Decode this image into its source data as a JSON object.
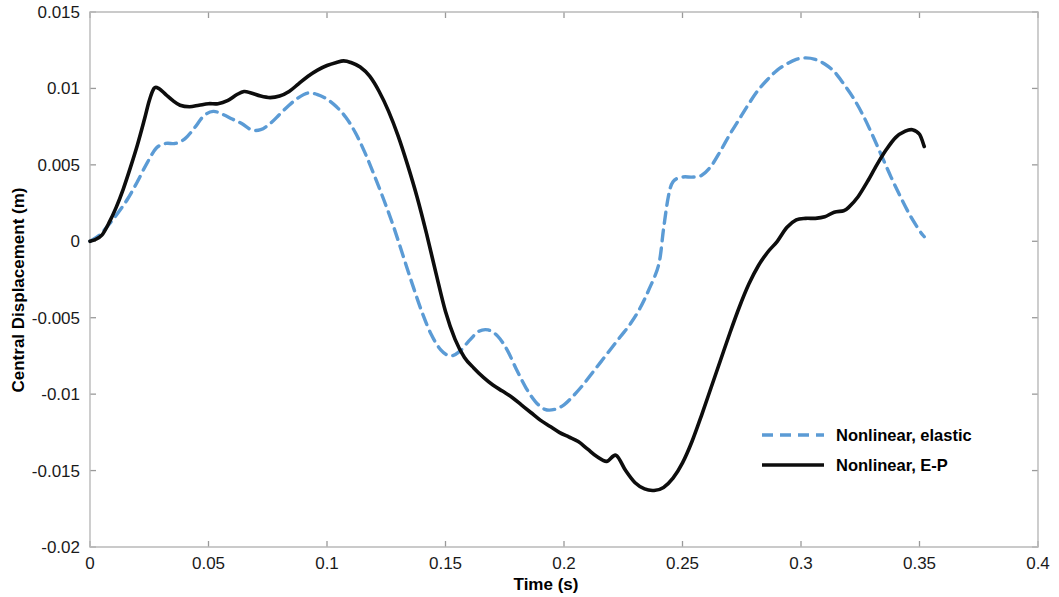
{
  "chart_data": {
    "type": "line",
    "title": "",
    "xlabel": "Time (s)",
    "ylabel": "Central Displacement (m)",
    "xlim": [
      0,
      0.4
    ],
    "ylim": [
      -0.02,
      0.015
    ],
    "xticks": [
      0,
      0.05,
      0.1,
      0.15,
      0.2,
      0.25,
      0.3,
      0.35,
      0.4
    ],
    "xtick_labels": [
      "0",
      "0.05",
      "0.1",
      "0.15",
      "0.2",
      "0.25",
      "0.3",
      "0.35",
      "0.4"
    ],
    "yticks": [
      -0.02,
      -0.015,
      -0.01,
      -0.005,
      0,
      0.005,
      0.01,
      0.015
    ],
    "ytick_labels": [
      "-0.02",
      "-0.015",
      "-0.01",
      "-0.005",
      "0",
      "0.005",
      "0.01",
      "0.015"
    ],
    "grid": false,
    "legend_position": "center-right",
    "series": [
      {
        "name": "Nonlinear, elastic",
        "color": "#5B9BD5",
        "style": "dashed",
        "width": 3.4,
        "dasharray": "11 7",
        "points": [
          [
            0.0,
            0.0
          ],
          [
            0.004,
            0.0004
          ],
          [
            0.008,
            0.0011
          ],
          [
            0.012,
            0.0019
          ],
          [
            0.016,
            0.0028
          ],
          [
            0.02,
            0.0039
          ],
          [
            0.024,
            0.0051
          ],
          [
            0.028,
            0.0061
          ],
          [
            0.032,
            0.0064
          ],
          [
            0.036,
            0.0064
          ],
          [
            0.04,
            0.0067
          ],
          [
            0.044,
            0.0074
          ],
          [
            0.048,
            0.0082
          ],
          [
            0.052,
            0.0085
          ],
          [
            0.056,
            0.0083
          ],
          [
            0.06,
            0.008
          ],
          [
            0.064,
            0.0077
          ],
          [
            0.068,
            0.0073
          ],
          [
            0.072,
            0.0073
          ],
          [
            0.076,
            0.0077
          ],
          [
            0.08,
            0.0083
          ],
          [
            0.084,
            0.0089
          ],
          [
            0.088,
            0.0094
          ],
          [
            0.092,
            0.0097
          ],
          [
            0.096,
            0.0096
          ],
          [
            0.1,
            0.0093
          ],
          [
            0.104,
            0.0088
          ],
          [
            0.108,
            0.0081
          ],
          [
            0.112,
            0.0071
          ],
          [
            0.116,
            0.0058
          ],
          [
            0.12,
            0.0043
          ],
          [
            0.124,
            0.0027
          ],
          [
            0.128,
            0.001
          ],
          [
            0.132,
            -0.0009
          ],
          [
            0.136,
            -0.0028
          ],
          [
            0.14,
            -0.0046
          ],
          [
            0.144,
            -0.0061
          ],
          [
            0.148,
            -0.0071
          ],
          [
            0.152,
            -0.0075
          ],
          [
            0.156,
            -0.0072
          ],
          [
            0.16,
            -0.0065
          ],
          [
            0.164,
            -0.0059
          ],
          [
            0.168,
            -0.0058
          ],
          [
            0.172,
            -0.0062
          ],
          [
            0.176,
            -0.0071
          ],
          [
            0.18,
            -0.0084
          ],
          [
            0.184,
            -0.0096
          ],
          [
            0.188,
            -0.0105
          ],
          [
            0.192,
            -0.011
          ],
          [
            0.196,
            -0.011
          ],
          [
            0.2,
            -0.0107
          ],
          [
            0.204,
            -0.0101
          ],
          [
            0.208,
            -0.0094
          ],
          [
            0.212,
            -0.0086
          ],
          [
            0.216,
            -0.0078
          ],
          [
            0.22,
            -0.007
          ],
          [
            0.224,
            -0.0062
          ],
          [
            0.228,
            -0.0054
          ],
          [
            0.232,
            -0.0044
          ],
          [
            0.236,
            -0.0031
          ],
          [
            0.24,
            -0.0015
          ],
          [
            0.242,
            0.0008
          ],
          [
            0.244,
            0.0029
          ],
          [
            0.246,
            0.0039
          ],
          [
            0.25,
            0.0042
          ],
          [
            0.254,
            0.0042
          ],
          [
            0.258,
            0.0043
          ],
          [
            0.262,
            0.0049
          ],
          [
            0.266,
            0.0059
          ],
          [
            0.27,
            0.007
          ],
          [
            0.274,
            0.008
          ],
          [
            0.278,
            0.009
          ],
          [
            0.282,
            0.0099
          ],
          [
            0.286,
            0.0106
          ],
          [
            0.29,
            0.0112
          ],
          [
            0.294,
            0.0116
          ],
          [
            0.298,
            0.0119
          ],
          [
            0.302,
            0.012
          ],
          [
            0.306,
            0.0119
          ],
          [
            0.31,
            0.0116
          ],
          [
            0.314,
            0.0111
          ],
          [
            0.318,
            0.0103
          ],
          [
            0.322,
            0.0094
          ],
          [
            0.326,
            0.0083
          ],
          [
            0.33,
            0.007
          ],
          [
            0.334,
            0.0056
          ],
          [
            0.338,
            0.0042
          ],
          [
            0.342,
            0.0029
          ],
          [
            0.346,
            0.0017
          ],
          [
            0.35,
            0.0007
          ],
          [
            0.352,
            0.0003
          ]
        ]
      },
      {
        "name": "Nonlinear, E-P",
        "color": "#0d0d0d",
        "style": "solid",
        "width": 3.6,
        "dasharray": "",
        "points": [
          [
            0.0,
            0.0
          ],
          [
            0.002,
            0.0001
          ],
          [
            0.005,
            0.0004
          ],
          [
            0.008,
            0.0012
          ],
          [
            0.011,
            0.0022
          ],
          [
            0.014,
            0.0034
          ],
          [
            0.017,
            0.0048
          ],
          [
            0.02,
            0.0063
          ],
          [
            0.023,
            0.008
          ],
          [
            0.025,
            0.0092
          ],
          [
            0.027,
            0.01
          ],
          [
            0.029,
            0.01
          ],
          [
            0.032,
            0.0096
          ],
          [
            0.035,
            0.0092
          ],
          [
            0.038,
            0.0089
          ],
          [
            0.042,
            0.0088
          ],
          [
            0.046,
            0.0089
          ],
          [
            0.05,
            0.009
          ],
          [
            0.054,
            0.009
          ],
          [
            0.058,
            0.0092
          ],
          [
            0.062,
            0.0096
          ],
          [
            0.065,
            0.0098
          ],
          [
            0.068,
            0.0097
          ],
          [
            0.072,
            0.0095
          ],
          [
            0.076,
            0.0094
          ],
          [
            0.08,
            0.0095
          ],
          [
            0.084,
            0.0098
          ],
          [
            0.088,
            0.0103
          ],
          [
            0.092,
            0.0108
          ],
          [
            0.096,
            0.0112
          ],
          [
            0.1,
            0.0115
          ],
          [
            0.104,
            0.0117
          ],
          [
            0.107,
            0.0118
          ],
          [
            0.11,
            0.0117
          ],
          [
            0.114,
            0.0114
          ],
          [
            0.118,
            0.0108
          ],
          [
            0.122,
            0.0098
          ],
          [
            0.126,
            0.0085
          ],
          [
            0.13,
            0.0069
          ],
          [
            0.134,
            0.005
          ],
          [
            0.138,
            0.0029
          ],
          [
            0.142,
            0.0005
          ],
          [
            0.146,
            -0.0021
          ],
          [
            0.15,
            -0.0046
          ],
          [
            0.154,
            -0.0064
          ],
          [
            0.158,
            -0.0076
          ],
          [
            0.162,
            -0.0083
          ],
          [
            0.166,
            -0.0089
          ],
          [
            0.17,
            -0.0094
          ],
          [
            0.174,
            -0.0098
          ],
          [
            0.178,
            -0.0102
          ],
          [
            0.182,
            -0.0107
          ],
          [
            0.186,
            -0.0112
          ],
          [
            0.19,
            -0.0117
          ],
          [
            0.194,
            -0.0121
          ],
          [
            0.198,
            -0.0125
          ],
          [
            0.202,
            -0.0128
          ],
          [
            0.206,
            -0.0131
          ],
          [
            0.21,
            -0.0136
          ],
          [
            0.214,
            -0.0141
          ],
          [
            0.218,
            -0.0144
          ],
          [
            0.222,
            -0.014
          ],
          [
            0.226,
            -0.015
          ],
          [
            0.23,
            -0.0158
          ],
          [
            0.234,
            -0.0162
          ],
          [
            0.238,
            -0.0163
          ],
          [
            0.242,
            -0.0161
          ],
          [
            0.246,
            -0.0155
          ],
          [
            0.25,
            -0.0145
          ],
          [
            0.254,
            -0.0131
          ],
          [
            0.258,
            -0.0114
          ],
          [
            0.262,
            -0.0096
          ],
          [
            0.266,
            -0.0078
          ],
          [
            0.27,
            -0.006
          ],
          [
            0.274,
            -0.0043
          ],
          [
            0.278,
            -0.0028
          ],
          [
            0.282,
            -0.0016
          ],
          [
            0.286,
            -0.0007
          ],
          [
            0.29,
            0.0
          ],
          [
            0.294,
            0.0009
          ],
          [
            0.298,
            0.0014
          ],
          [
            0.302,
            0.0015
          ],
          [
            0.306,
            0.0015
          ],
          [
            0.31,
            0.0016
          ],
          [
            0.314,
            0.0019
          ],
          [
            0.318,
            0.002
          ],
          [
            0.32,
            0.0022
          ],
          [
            0.324,
            0.0029
          ],
          [
            0.328,
            0.0039
          ],
          [
            0.332,
            0.005
          ],
          [
            0.336,
            0.006
          ],
          [
            0.34,
            0.0068
          ],
          [
            0.344,
            0.0072
          ],
          [
            0.347,
            0.0073
          ],
          [
            0.35,
            0.007
          ],
          [
            0.352,
            0.0062
          ]
        ]
      }
    ]
  },
  "legend": {
    "entries": [
      {
        "label": "Nonlinear, elastic"
      },
      {
        "label": "Nonlinear, E-P"
      }
    ]
  },
  "axes": {
    "x_title": "Time (s)",
    "y_title": "Central Displacement (m)"
  }
}
